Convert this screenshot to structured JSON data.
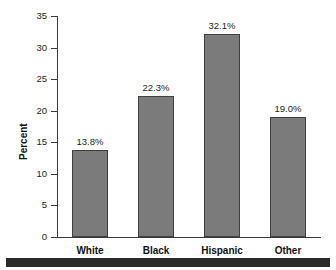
{
  "chart_data": {
    "type": "bar",
    "title": "",
    "subtitle": "",
    "xlabel": "",
    "ylabel": "Percent",
    "categories": [
      "White",
      "Black",
      "Hispanic",
      "Other"
    ],
    "values": [
      13.8,
      22.3,
      32.1,
      19.0
    ],
    "data_labels": [
      "13.8%",
      "22.3%",
      "32.1%",
      "19.0%"
    ],
    "ylim": [
      0,
      35
    ],
    "ytick_labels": [
      "0",
      "5",
      "10",
      "15",
      "20",
      "25",
      "30",
      "35"
    ],
    "ytick_values": [
      0,
      5,
      10,
      15,
      20,
      25,
      30,
      35
    ],
    "grid": false,
    "legend": null,
    "legend_position": "none",
    "bar_color": "#7b7b7b",
    "bar_edge_color": "#3f3f3f",
    "axis_color": "#3a3a3a",
    "background_color": "#ffffff",
    "text_color": "#1d1d1d",
    "footer_rule_color": "#2b2b2b"
  }
}
